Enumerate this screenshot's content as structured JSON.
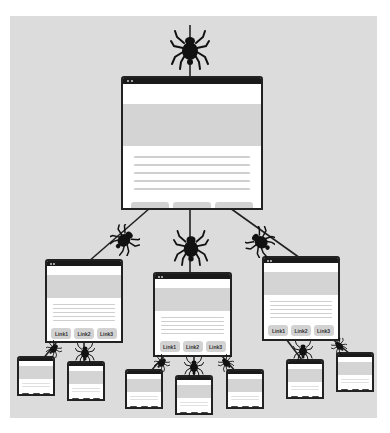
{
  "diagram": {
    "colors": {
      "canvas": "#dcdcdc",
      "window_border": "#222222",
      "link_button": "#d2d2d2",
      "spider": "#111111"
    },
    "root": {
      "links": [
        "Link1",
        "Link2",
        "Link3"
      ]
    },
    "level2": [
      {
        "links": [
          "Link1",
          "Link2",
          "Link3"
        ]
      },
      {
        "links": [
          "Link1",
          "Link2",
          "Link3"
        ]
      },
      {
        "links": [
          "Link1",
          "Link2",
          "Link3"
        ]
      }
    ],
    "icons": {
      "spider": "spider-icon",
      "window": "browser-window-icon"
    }
  }
}
